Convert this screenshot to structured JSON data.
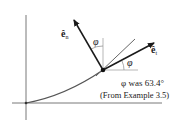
{
  "diagram": {
    "labels": {
      "en": "ê",
      "en_sub": "n",
      "et": "ê",
      "et_sub": "t",
      "phi_upper": "φ",
      "phi_lower": "φ",
      "note_line1": "φ was 63.4°",
      "note_line2": "(From Example 3.5)"
    },
    "colors": {
      "axis": "#555555",
      "curve": "#555555",
      "vector": "#1a1a1a",
      "reference": "#999999",
      "tangent": "#666666"
    }
  }
}
